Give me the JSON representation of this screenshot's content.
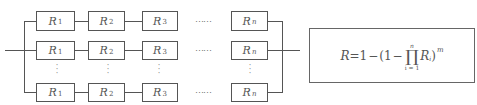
{
  "diagram": {
    "type": "series-parallel reliability block diagram",
    "rows": [
      {
        "blocks": [
          "R",
          "R",
          "R",
          "R"
        ],
        "subscripts": [
          "1",
          "2",
          "3",
          "n"
        ],
        "ellipsis": "……"
      },
      {
        "blocks": [
          "R",
          "R",
          "R",
          "R"
        ],
        "subscripts": [
          "1",
          "2",
          "3",
          "n"
        ],
        "ellipsis": "……"
      },
      {
        "blocks": [
          "R",
          "R",
          "R",
          "R"
        ],
        "subscripts": [
          "1",
          "2",
          "3",
          "n"
        ],
        "ellipsis": "……"
      }
    ],
    "vertical_ellipsis": "⋮",
    "formula": {
      "lhs": "R",
      "eq": "=",
      "one_a": "1",
      "minus_a": "−",
      "open": "(",
      "one_b": "1",
      "minus_b": "−",
      "prod_symbol": "∏",
      "prod_upper": "n",
      "prod_lower": "i = 1",
      "term": "R",
      "term_sub": "i",
      "close": ")",
      "exponent": "m"
    }
  }
}
